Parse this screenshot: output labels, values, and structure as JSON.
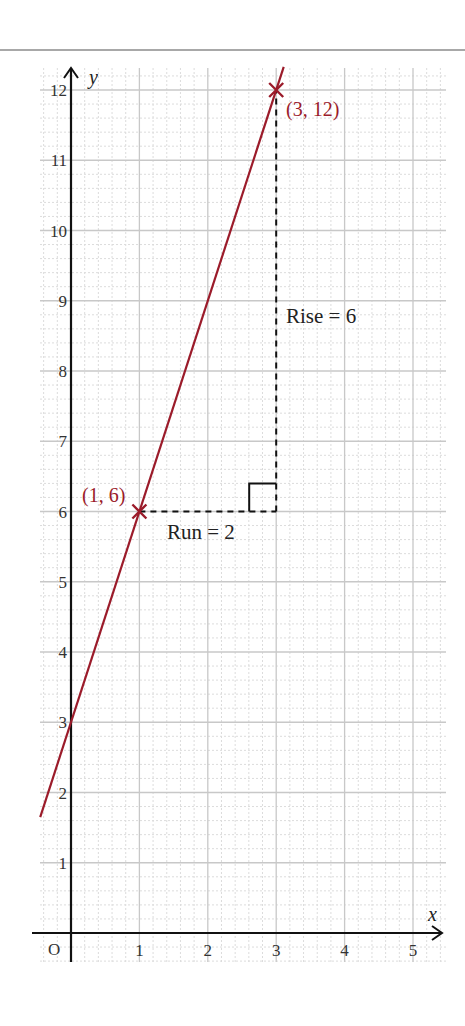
{
  "chart_data": {
    "type": "line",
    "title": "",
    "xlabel": "x",
    "ylabel": "y",
    "origin_label": "O",
    "xlim": [
      -0.45,
      5.45
    ],
    "ylim": [
      -0.42,
      12.3
    ],
    "grid": true,
    "x_ticks": [
      1,
      2,
      3,
      4,
      5
    ],
    "y_ticks": [
      1,
      2,
      3,
      4,
      5,
      6,
      7,
      8,
      9,
      10,
      11,
      12
    ],
    "series": [
      {
        "name": "y = 3x + 3",
        "slope": 3,
        "intercept": 3,
        "x": [
          -0.45,
          3.11
        ],
        "y": [
          1.65,
          12.33
        ],
        "color": "#9b1b2a"
      }
    ],
    "points": [
      {
        "x": 1,
        "y": 6,
        "label": "(1, 6)",
        "marker": "cross"
      },
      {
        "x": 3,
        "y": 12,
        "label": "(3, 12)",
        "marker": "cross"
      }
    ],
    "annotations": {
      "run": {
        "label": "Run = 2",
        "from": [
          1,
          6
        ],
        "to": [
          3,
          6
        ]
      },
      "rise": {
        "label": "Rise = 6",
        "from": [
          3,
          6
        ],
        "to": [
          3,
          12
        ]
      },
      "right_angle_at": [
        3,
        6
      ]
    }
  },
  "colors": {
    "line": "#9b1b2a",
    "axis": "#111111",
    "major_grid": "#c8c8c8",
    "minor_grid": "#dcdcdc",
    "rule": "#a8a8a8"
  }
}
